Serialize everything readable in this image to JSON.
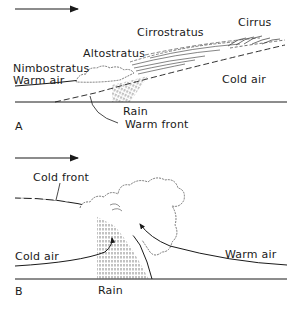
{
  "diagram": {
    "wind_direction": "left-to-right",
    "colors": {
      "ink": "#1a1a1a",
      "background": "#ffffff"
    },
    "panel_a": {
      "letter": "A",
      "labels": {
        "cirrus": "Cirrus",
        "cirrostratus": "Cirrostratus",
        "altostratus": "Altostratus",
        "nimbostratus": "Nimbostratus",
        "warm_air": "Warm air",
        "cold_air": "Cold air",
        "rain": "Rain",
        "front": "Warm front"
      }
    },
    "panel_b": {
      "letter": "B",
      "labels": {
        "front": "Cold front",
        "cold_air": "Cold air",
        "warm_air": "Warm air",
        "rain": "Rain"
      }
    }
  }
}
